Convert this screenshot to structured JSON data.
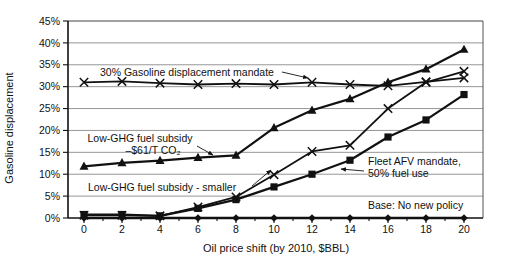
{
  "chart_data": {
    "type": "line",
    "title": "",
    "xlabel": "Oil price shift (by 2010, $BBL)",
    "ylabel": "Gasoline displacement",
    "xlim": [
      0,
      20
    ],
    "ylim": [
      0,
      45
    ],
    "grid": "horizontal",
    "legend_position": "inline-annotations",
    "x": [
      0,
      2,
      4,
      6,
      8,
      10,
      12,
      14,
      16,
      18,
      20
    ],
    "x_tick_labels": [
      "0",
      "2",
      "4",
      "6",
      "8",
      "10",
      "12",
      "14",
      "16",
      "18",
      "20"
    ],
    "y_tick_labels": [
      "0%",
      "5%",
      "10%",
      "15%",
      "20%",
      "25%",
      "30%",
      "35%",
      "40%",
      "45%"
    ],
    "line_color": "#111111",
    "grid_color": "#8a8a8a",
    "series": [
      {
        "key": "mandate30",
        "name": "30% Gasoline displacement mandate",
        "marker": "x",
        "values": [
          31,
          31.2,
          30.8,
          30.5,
          30.7,
          30.5,
          31,
          30.5,
          30.2,
          31.1,
          32
        ]
      },
      {
        "key": "subsidy61",
        "name": "Low-GHG fuel subsidy –$61/T CO₂",
        "marker": "triangle",
        "values": [
          11.8,
          12.6,
          13.1,
          13.8,
          14.3,
          20.6,
          24.6,
          27.2,
          31,
          34,
          38.5
        ]
      },
      {
        "key": "subsidySmaller",
        "name": "Low-GHG fuel subsidy - smaller",
        "marker": "x",
        "values": [
          0.6,
          0.6,
          0.5,
          2.5,
          4.8,
          9.9,
          15.2,
          16.6,
          25,
          31,
          33.5
        ]
      },
      {
        "key": "fleetAfv",
        "name": "Fleet AFV mandate, 50% fuel use",
        "marker": "square",
        "values": [
          0.8,
          0.8,
          0.5,
          2.2,
          4.2,
          7.1,
          10,
          13.2,
          18.5,
          22.4,
          28.2
        ]
      },
      {
        "key": "base",
        "name": "Base: No new policy",
        "marker": "diamond",
        "values": [
          0,
          0,
          0,
          0,
          0,
          0,
          0,
          0,
          0,
          0,
          0
        ]
      }
    ],
    "annotations": [
      {
        "key": "label-mandate30",
        "anchor": "start",
        "lines": [
          {
            "text": "30% Gasoline displacement mandate",
            "x": 100,
            "y": 76
          }
        ],
        "arrow": {
          "x1": 282,
          "y1": 72,
          "x2": 308,
          "y2": 78
        }
      },
      {
        "key": "label-subsidy61",
        "anchor": "middle",
        "lines": [
          {
            "text": "Low-GHG fuel subsidy",
            "x": 140,
            "y": 142
          },
          {
            "text": "–$61/T CO₂",
            "x": 153,
            "y": 154
          }
        ],
        "arrow": {
          "x1": 197,
          "y1": 146,
          "x2": 213,
          "y2": 155
        }
      },
      {
        "key": "label-subsidySmaller",
        "anchor": "start",
        "lines": [
          {
            "text": "Low-GHG fuel subsidy - smaller",
            "x": 88,
            "y": 191
          }
        ],
        "arrow": {
          "x1": 252,
          "y1": 186,
          "x2": 271,
          "y2": 170
        }
      },
      {
        "key": "label-fleetAfv",
        "anchor": "start",
        "lines": [
          {
            "text": "Fleet AFV mandate,",
            "x": 368,
            "y": 165
          },
          {
            "text": "50% fuel use",
            "x": 368,
            "y": 177
          }
        ],
        "arrow": {
          "x1": 364,
          "y1": 171,
          "x2": 341,
          "y2": 169
        }
      },
      {
        "key": "label-base",
        "anchor": "start",
        "lines": [
          {
            "text": "Base: No new policy",
            "x": 368,
            "y": 209
          }
        ]
      }
    ]
  }
}
